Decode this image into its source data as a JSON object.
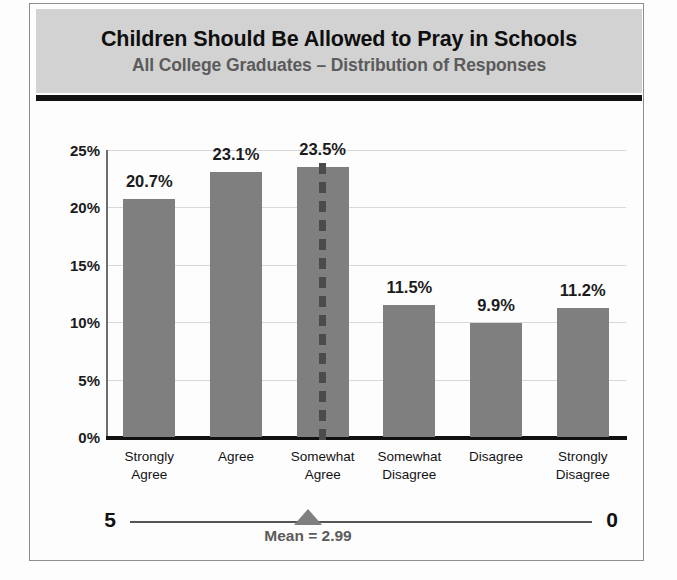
{
  "header": {
    "title": "Children Should Be Allowed to Pray in Schools",
    "subtitle": "All College Graduates – Distribution of Responses",
    "banner_color": "#d2d2d2",
    "rule_color": "#111111"
  },
  "scale": {
    "left_label": "5",
    "right_label": "0",
    "mean_label": "Mean = 2.99",
    "mean_value": 2.99,
    "marker_color": "#7f7f7f"
  },
  "colors": {
    "bar": "#7f7f7f",
    "gridline": "#d8d8d8",
    "axis": "#111111",
    "title_text": "#0f0f0f",
    "subtitle_text": "#5b5b5b",
    "dashed_line": "#4b4b4b"
  },
  "chart_data": {
    "type": "bar",
    "title": "Children Should Be Allowed to Pray in Schools",
    "subtitle": "All College Graduates – Distribution of Responses",
    "xlabel": "",
    "ylabel": "",
    "categories": [
      "Strongly\nAgree",
      "Agree",
      "Somewhat\nAgree",
      "Somewhat\nDisagree",
      "Disagree",
      "Strongly\nDisagree"
    ],
    "values": [
      20.7,
      23.1,
      23.5,
      11.5,
      9.9,
      11.2
    ],
    "data_labels": [
      "20.7%",
      "23.1%",
      "23.5%",
      "11.5%",
      "9.9%",
      "11.2%"
    ],
    "ylim": [
      0,
      25
    ],
    "yticks": [
      0,
      5,
      10,
      15,
      20,
      25
    ],
    "ytick_labels": [
      "0%",
      "5%",
      "10%",
      "15%",
      "20%",
      "25%"
    ],
    "grid": true,
    "grid_axis": "y",
    "legend": false,
    "annotations": [
      {
        "name": "mean-dashed-line",
        "type": "vline",
        "category_index": 2,
        "label": "Mean = 2.99"
      }
    ]
  }
}
